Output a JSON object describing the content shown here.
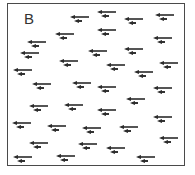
{
  "figure": {
    "panel_label": "B",
    "colors": {
      "frame": "#4a4a4a",
      "arrow": "#2b2b2b",
      "background": "#ffffff"
    },
    "arrow_pairs": [
      {
        "x": 70,
        "y": 16
      },
      {
        "x": 97,
        "y": 11
      },
      {
        "x": 124,
        "y": 18
      },
      {
        "x": 155,
        "y": 14
      },
      {
        "x": 55,
        "y": 33
      },
      {
        "x": 97,
        "y": 29
      },
      {
        "x": 153,
        "y": 37
      },
      {
        "x": 27,
        "y": 41
      },
      {
        "x": 88,
        "y": 50
      },
      {
        "x": 124,
        "y": 48
      },
      {
        "x": 20,
        "y": 52
      },
      {
        "x": 59,
        "y": 60
      },
      {
        "x": 106,
        "y": 64
      },
      {
        "x": 159,
        "y": 62
      },
      {
        "x": 13,
        "y": 69
      },
      {
        "x": 134,
        "y": 71
      },
      {
        "x": 32,
        "y": 83
      },
      {
        "x": 72,
        "y": 82
      },
      {
        "x": 97,
        "y": 86
      },
      {
        "x": 153,
        "y": 87
      },
      {
        "x": 126,
        "y": 98
      },
      {
        "x": 29,
        "y": 105
      },
      {
        "x": 64,
        "y": 104
      },
      {
        "x": 97,
        "y": 109
      },
      {
        "x": 153,
        "y": 116
      },
      {
        "x": 12,
        "y": 122
      },
      {
        "x": 47,
        "y": 125
      },
      {
        "x": 82,
        "y": 127
      },
      {
        "x": 119,
        "y": 126
      },
      {
        "x": 29,
        "y": 142
      },
      {
        "x": 78,
        "y": 143
      },
      {
        "x": 159,
        "y": 137
      },
      {
        "x": 106,
        "y": 147
      },
      {
        "x": 13,
        "y": 156
      },
      {
        "x": 56,
        "y": 155
      },
      {
        "x": 136,
        "y": 156
      }
    ]
  }
}
